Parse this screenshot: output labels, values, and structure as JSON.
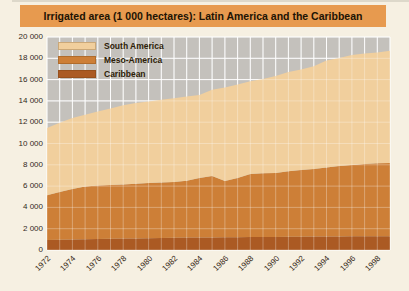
{
  "page": {
    "bg": "#f6f0e2",
    "photo_edge": "#c9c4b6"
  },
  "title_bar": {
    "text": "Irrigated area (1 000 hectares): Latin America and the Caribbean",
    "bg": "#e79a4f",
    "text_color": "#201304"
  },
  "chart_data": {
    "type": "area",
    "stacked": true,
    "title": "Irrigated area (1 000 hectares): Latin America and the Caribbean",
    "ylabel": "1 000 hectares",
    "xlabel": "",
    "x": [
      1972,
      1973,
      1974,
      1975,
      1976,
      1977,
      1978,
      1979,
      1980,
      1981,
      1982,
      1983,
      1984,
      1985,
      1986,
      1987,
      1988,
      1989,
      1990,
      1991,
      1992,
      1993,
      1994,
      1995,
      1996,
      1997,
      1998,
      1999
    ],
    "x_tick_labels": [
      "1972",
      "1974",
      "1976",
      "1978",
      "1980",
      "1982",
      "1984",
      "1986",
      "1988",
      "1990",
      "1992",
      "1994",
      "1996",
      "1998"
    ],
    "y_ticks": [
      0,
      2000,
      4000,
      6000,
      8000,
      10000,
      12000,
      14000,
      16000,
      18000,
      20000
    ],
    "y_tick_labels": [
      "0",
      "2 000",
      "4 000",
      "6 000",
      "8 000",
      "10 000",
      "12 000",
      "14 000",
      "16 000",
      "18 000",
      "20 000"
    ],
    "ylim": [
      0,
      20000
    ],
    "grid": true,
    "plot_bg": "#c4c1bc",
    "grid_color": "#ffffff",
    "legend_position": "top-left",
    "stack_order_bottom_to_top": [
      "Caribbean",
      "Meso-America",
      "South America"
    ],
    "series": [
      {
        "name": "South America",
        "color": "#f1cf9d",
        "values": [
          6300,
          6500,
          6660,
          6750,
          6940,
          7200,
          7450,
          7570,
          7660,
          7770,
          7860,
          7900,
          7790,
          8100,
          8770,
          8790,
          8710,
          8850,
          9120,
          9300,
          9440,
          9640,
          10040,
          10160,
          10310,
          10370,
          10410,
          10530
        ]
      },
      {
        "name": "Meso-America",
        "color": "#cd7f37",
        "values": [
          4200,
          4480,
          4740,
          4940,
          5030,
          5050,
          5080,
          5140,
          5180,
          5200,
          5240,
          5340,
          5590,
          5770,
          5290,
          5560,
          5930,
          5980,
          6000,
          6160,
          6260,
          6350,
          6480,
          6600,
          6700,
          6785,
          6840,
          6870
        ]
      },
      {
        "name": "Caribbean",
        "color": "#ab5a23",
        "values": [
          950,
          970,
          990,
          1010,
          1030,
          1050,
          1070,
          1090,
          1110,
          1130,
          1150,
          1160,
          1170,
          1180,
          1190,
          1200,
          1210,
          1220,
          1230,
          1240,
          1250,
          1260,
          1270,
          1280,
          1290,
          1295,
          1300,
          1300
        ]
      }
    ]
  }
}
